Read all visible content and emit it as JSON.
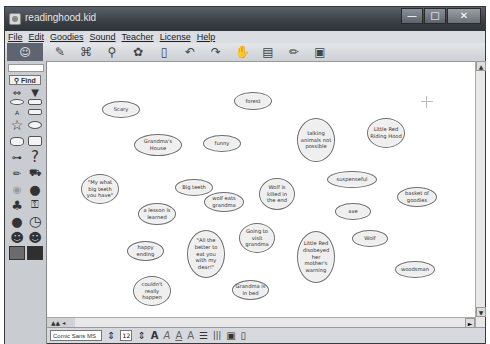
{
  "window": {
    "title": "readinghood.kid",
    "controls": {
      "minimize": "—",
      "maximize": "□",
      "close": "✕"
    }
  },
  "menubar": {
    "items": [
      "File",
      "Edit",
      "Goodies",
      "Sound",
      "Teacher",
      "License",
      "Help"
    ]
  },
  "toolbar": {
    "buttons": [
      {
        "name": "picture-to-topic",
        "glyph": "✎"
      },
      {
        "name": "outline-diagram",
        "glyph": "⌘"
      },
      {
        "name": "link",
        "glyph": "⚲"
      },
      {
        "name": "symbols",
        "glyph": "✿"
      },
      {
        "name": "eraser",
        "glyph": "▯"
      },
      {
        "name": "undo",
        "glyph": "↶"
      },
      {
        "name": "redo",
        "glyph": "↷"
      },
      {
        "name": "hand-pointer",
        "glyph": "✋"
      },
      {
        "name": "notes",
        "glyph": "▤"
      },
      {
        "name": "pencil",
        "glyph": "✏"
      },
      {
        "name": "map-view",
        "glyph": "▣"
      }
    ]
  },
  "sidebar": {
    "find_label": "Find",
    "tools": [
      {
        "name": "arrows",
        "glyph": "⇔"
      },
      {
        "name": "dropdown",
        "glyph": "▼"
      },
      {
        "name": "oval",
        "glyph": ""
      },
      {
        "name": "rectangle",
        "glyph": ""
      },
      {
        "name": "label",
        "glyph": "A"
      },
      {
        "name": "rounded-rect",
        "glyph": ""
      },
      {
        "name": "star",
        "glyph": "☆"
      },
      {
        "name": "cloud",
        "glyph": "☁"
      },
      {
        "name": "speech-bubble",
        "glyph": "💬"
      },
      {
        "name": "paper",
        "glyph": "▭"
      },
      {
        "name": "bone",
        "glyph": "⊶"
      },
      {
        "name": "question",
        "glyph": "?"
      },
      {
        "name": "pencil",
        "glyph": "✏"
      },
      {
        "name": "truck",
        "glyph": "⛟"
      },
      {
        "name": "lightbulb",
        "glyph": "💡"
      },
      {
        "name": "globe",
        "glyph": "🌐"
      },
      {
        "name": "tree",
        "glyph": "♣"
      },
      {
        "name": "key",
        "glyph": "⚿"
      },
      {
        "name": "apple",
        "glyph": "●"
      },
      {
        "name": "clock",
        "glyph": "◷"
      },
      {
        "name": "person-boy",
        "glyph": "☻"
      },
      {
        "name": "person-girl",
        "glyph": "☻"
      }
    ]
  },
  "canvas": {
    "nodes": [
      {
        "text": "Scary",
        "x": 55,
        "y": 39,
        "w": 38,
        "h": 17
      },
      {
        "text": "forest",
        "x": 187,
        "y": 30,
        "w": 38,
        "h": 18
      },
      {
        "text": "Grandma's House",
        "x": 87,
        "y": 72,
        "w": 48,
        "h": 22
      },
      {
        "text": "funny",
        "x": 156,
        "y": 73,
        "w": 38,
        "h": 17
      },
      {
        "text": "talking animals not possible",
        "x": 250,
        "y": 56,
        "w": 38,
        "h": 44
      },
      {
        "text": "Little Red Riding Hood",
        "x": 320,
        "y": 56,
        "w": 38,
        "h": 30
      },
      {
        "text": "\"My what big teeth you have\"",
        "x": 34,
        "y": 112,
        "w": 38,
        "h": 30
      },
      {
        "text": "Big teeth",
        "x": 128,
        "y": 117,
        "w": 38,
        "h": 17
      },
      {
        "text": "wolf eats grandma",
        "x": 157,
        "y": 130,
        "w": 40,
        "h": 20
      },
      {
        "text": "Wolf is killed in the end",
        "x": 212,
        "y": 116,
        "w": 36,
        "h": 32
      },
      {
        "text": "suspenseful",
        "x": 280,
        "y": 109,
        "w": 50,
        "h": 17
      },
      {
        "text": "basket of goodies",
        "x": 350,
        "y": 125,
        "w": 40,
        "h": 20
      },
      {
        "text": "a lesson is learned",
        "x": 91,
        "y": 141,
        "w": 38,
        "h": 22
      },
      {
        "text": "axe",
        "x": 288,
        "y": 141,
        "w": 36,
        "h": 17
      },
      {
        "text": "Going to visit grandma",
        "x": 192,
        "y": 161,
        "w": 36,
        "h": 30
      },
      {
        "text": "\"All the better to eat you with my dear!\"",
        "x": 140,
        "y": 168,
        "w": 38,
        "h": 48
      },
      {
        "text": "Wolf",
        "x": 305,
        "y": 168,
        "w": 36,
        "h": 17
      },
      {
        "text": "happy ending",
        "x": 80,
        "y": 179,
        "w": 37,
        "h": 20
      },
      {
        "text": "Little Red disobeyed her mother's warning",
        "x": 250,
        "y": 169,
        "w": 38,
        "h": 52
      },
      {
        "text": "woodsman",
        "x": 348,
        "y": 199,
        "w": 40,
        "h": 17
      },
      {
        "text": "couldn't really happen",
        "x": 86,
        "y": 214,
        "w": 38,
        "h": 30
      },
      {
        "text": "Grandma is in bed",
        "x": 185,
        "y": 218,
        "w": 37,
        "h": 20
      }
    ]
  },
  "scrollbars": {
    "up_arrow": "▲",
    "down_arrow": "▼",
    "right_arrow": "►",
    "zoom_label": "▲▲ ◂"
  },
  "fontbar": {
    "font_name": "Comic Sans MS",
    "font_size": "12",
    "buttons": [
      {
        "name": "size-stepper",
        "glyph": "⇕"
      },
      {
        "name": "bold",
        "glyph": "A"
      },
      {
        "name": "italic",
        "glyph": "A"
      },
      {
        "name": "underline",
        "glyph": "A"
      },
      {
        "name": "superscript",
        "glyph": "A"
      },
      {
        "name": "align-lines",
        "glyph": "☰"
      },
      {
        "name": "columns",
        "glyph": "|||"
      },
      {
        "name": "frame",
        "glyph": "▣"
      },
      {
        "name": "color-swatch",
        "glyph": "▯"
      }
    ]
  }
}
